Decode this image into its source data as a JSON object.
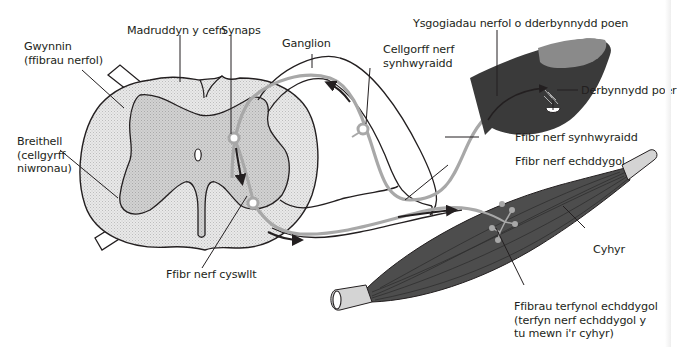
{
  "figure": {
    "colors": {
      "outline": "#231f20",
      "white_matter": "#e6e6e6",
      "grey_matter": "#cfcfcf",
      "nerve_fibre": "#a8a8a8",
      "finger_skin": "#3a3a3a",
      "fingernail": "#8a8a8a",
      "muscle": "#4d4d4d",
      "tendon": "#d4d4d4",
      "background": "#ffffff"
    }
  },
  "labels": {
    "white_matter": {
      "line1": "Gwynnin",
      "line2": "(ffibrau nerfol)"
    },
    "spinal_cord": "Madruddyn y cefn",
    "synapse": "Synaps",
    "ganglion": "Ganglion",
    "sensory_cell_body": {
      "line1": "Cellgorff nerf",
      "line2": "synhwyraidd"
    },
    "nerve_impulses": "Ysgogiadau nerfol o dderbynnydd poen",
    "pain_receptor": "Derbynnydd poer",
    "grey_matter": {
      "line1": "Breithell",
      "line2": "(cellgyrff",
      "line3": "niwronau)"
    },
    "sensory_fibre": "Ffibr nerf synhwyraidd",
    "motor_fibre": "Ffibr nerf echddygol",
    "muscle": "Cyhyr",
    "relay_fibre": "Ffibr nerf cyswllt",
    "motor_end_fibres": {
      "line1": "Ffibrau terfynol echddygol",
      "line2": "(terfyn nerf echddygol y",
      "line3": "tu mewn i'r cyhyr)"
    }
  }
}
